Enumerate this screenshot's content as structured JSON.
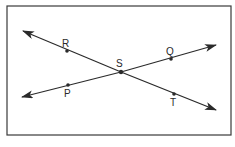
{
  "diagram": {
    "type": "intersecting-lines",
    "lines": [
      {
        "name": "line RT",
        "points": [
          "R",
          "S",
          "T"
        ]
      },
      {
        "name": "line PQ",
        "points": [
          "P",
          "S",
          "Q"
        ]
      }
    ],
    "points": {
      "R": "R",
      "Q": "Q",
      "S": "S",
      "P": "P",
      "T": "T"
    },
    "intersection": "S",
    "colors": {
      "stroke": "#2a2a2a",
      "frame": "#3a3a3a",
      "background": "#ffffff"
    }
  }
}
